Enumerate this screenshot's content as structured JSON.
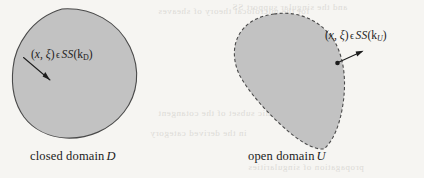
{
  "figure": {
    "background_color": "#f6f5f2",
    "ink_color": "#1d1d1d",
    "blob_fill_color": "#c2c2c2",
    "blob_stroke_color": "#4a4a4a"
  },
  "panels": [
    {
      "id": "closed-domain",
      "caption_prefix": "closed domain",
      "caption_symbol": "D",
      "boundary_style": "solid",
      "arrow_direction": "inward",
      "label": {
        "open_paren": "(",
        "x": "x",
        "comma": ", ",
        "xi": "ξ",
        "close_paren": ")",
        "membership": "ϵ",
        "operator": "SS",
        "arg_open": "(",
        "arg_base": "k",
        "arg_sub": "D",
        "arg_close": ")",
        "full_text": "(x, ξ) ϵ SS(k_D)"
      }
    },
    {
      "id": "open-domain",
      "caption_prefix": "open domain",
      "caption_symbol": "U",
      "boundary_style": "dashed",
      "arrow_direction": "outward",
      "label": {
        "open_paren": "(",
        "x": "x",
        "comma": ", ",
        "xi": "ξ",
        "close_paren": ")",
        "membership": "ϵ",
        "operator": "SS",
        "arg_open": "(",
        "arg_base": "k",
        "arg_sub": "U",
        "arg_close": ")",
        "full_text": "(x, ξ) ϵ SS(k_U)"
      }
    }
  ],
  "bleed_through": {
    "lines": [
      "for the microlocal theory of sheaves",
      "and the singular support SS",
      "conic subset of the cotangent",
      "in the derived category",
      "propagation of singularities"
    ]
  }
}
